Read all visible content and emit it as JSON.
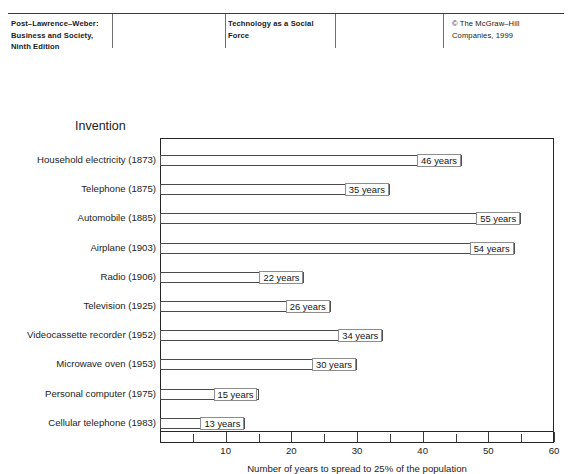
{
  "header": {
    "left": {
      "lines": [
        "Post–Lawrence–Weber:",
        "Business and Society,",
        "Ninth Edition"
      ]
    },
    "middle": {
      "lines": [
        "Technology as a Social",
        "Force"
      ]
    },
    "right": {
      "lines": [
        "© The McGraw–Hill",
        "Companies, 1999"
      ]
    }
  },
  "chart_data": {
    "type": "bar",
    "orientation": "horizontal",
    "title": "Invention",
    "xlabel": "Number of years to spread to 25% of the population",
    "ylabel": "Invention",
    "xlim": [
      0,
      60
    ],
    "grid": false,
    "legend": "none",
    "value_suffix": "years",
    "x_major_ticks": [
      10,
      20,
      30,
      40,
      50,
      60
    ],
    "x_minor_ticks": [
      5,
      15,
      25,
      35,
      45,
      55
    ],
    "x_tick_labels": [
      "10",
      "20",
      "30",
      "40",
      "50",
      "60"
    ],
    "categories": [
      "Household electricity (1873)",
      "Telephone (1875)",
      "Automobile (1885)",
      "Airplane (1903)",
      "Radio (1906)",
      "Television (1925)",
      "Videocassette recorder (1952)",
      "Microwave oven (1953)",
      "Personal computer (1975)",
      "Cellular telephone (1983)"
    ],
    "values": [
      46,
      35,
      55,
      54,
      22,
      26,
      34,
      30,
      15,
      13
    ],
    "value_labels": [
      "46 years",
      "35 years",
      "55 years",
      "54 years",
      "22 years",
      "26 years",
      "34 years",
      "30 years",
      "15 years",
      "13 years"
    ]
  }
}
